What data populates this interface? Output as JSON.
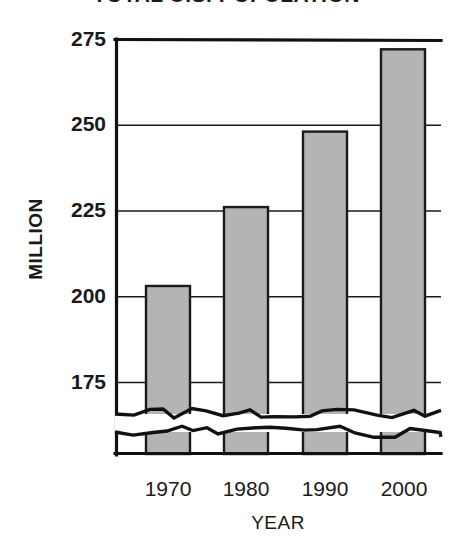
{
  "chart_data": {
    "type": "bar",
    "title": "TOTAL U.S. POPULATION",
    "xlabel": "YEAR",
    "ylabel": "MILLION",
    "categories": [
      "1970",
      "1980",
      "1990",
      "2000"
    ],
    "values": [
      203,
      226,
      248,
      272
    ],
    "ytick_labels": [
      "275",
      "250",
      "225",
      "200",
      "175"
    ],
    "ytick_values": [
      275,
      250,
      225,
      200,
      175
    ],
    "ylim": [
      175,
      275
    ],
    "xlim": [
      "1965",
      "2005"
    ],
    "grid": true,
    "legend": "none",
    "axis_break": true,
    "axis_break_note": "y-axis broken below 175 (zigzag band at base)",
    "bar_fill_color": "#b4b4b4",
    "bar_edge_color": "#1a1a1a",
    "grid_color": "#1a1a1a",
    "background_color": "#ffffff"
  },
  "axis_labels": {
    "y_title": "MILLION",
    "x_title": "YEAR"
  }
}
